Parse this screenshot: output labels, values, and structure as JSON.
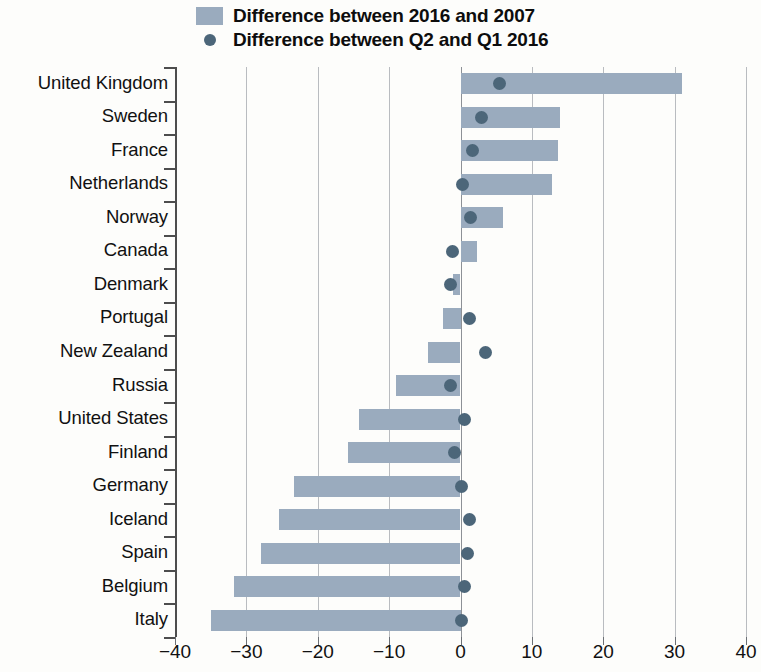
{
  "legend": {
    "entries": [
      {
        "label": "Difference between 2016 and 2007",
        "marker": "bar-swatch",
        "color": "#9aabbe"
      },
      {
        "label": "Difference between Q2 and Q1 2016",
        "marker": "dot",
        "color": "#4c6679"
      }
    ]
  },
  "chart_data": {
    "type": "bar",
    "orientation": "horizontal",
    "title": "",
    "xlabel": "",
    "ylabel": "",
    "xlim": [
      -40,
      40
    ],
    "xticks": [
      -40,
      -30,
      -20,
      -10,
      0,
      10,
      20,
      30,
      40
    ],
    "xticklabels": [
      "−40",
      "−30",
      "−20",
      "−10",
      "0",
      "10",
      "20",
      "30",
      "40"
    ],
    "grid": true,
    "legend_position": "top",
    "categories": [
      "United Kingdom",
      "Sweden",
      "France",
      "Netherlands",
      "Norway",
      "Canada",
      "Denmark",
      "Portugal",
      "New Zealand",
      "Russia",
      "United States",
      "Finland",
      "Germany",
      "Iceland",
      "Spain",
      "Belgium",
      "Italy"
    ],
    "series": [
      {
        "name": "Difference between 2016 and 2007",
        "type": "bar",
        "color": "#9aabbe",
        "values": [
          31.0,
          14.0,
          13.7,
          12.8,
          6.0,
          2.3,
          -1.0,
          -2.5,
          -4.5,
          -9.0,
          -14.2,
          -15.7,
          -23.3,
          -25.4,
          -28.0,
          -31.7,
          -35.0
        ]
      },
      {
        "name": "Difference between Q2 and Q1 2016",
        "type": "scatter",
        "color": "#4c6679",
        "values": [
          5.5,
          3.0,
          1.7,
          0.3,
          1.4,
          -1.1,
          -1.4,
          1.2,
          3.5,
          -1.4,
          0.6,
          -0.8,
          0.2,
          1.3,
          1.0,
          0.6,
          0.1
        ]
      }
    ]
  }
}
